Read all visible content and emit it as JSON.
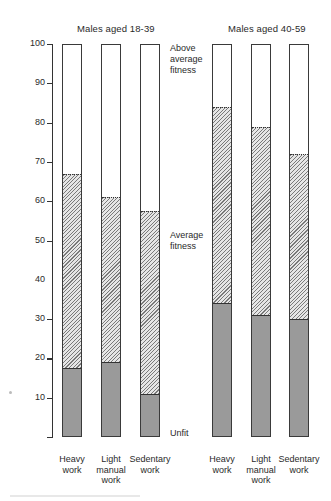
{
  "chart_data": {
    "type": "bar",
    "stacked": true,
    "title": "",
    "xlabel": "",
    "ylabel": "",
    "ylim": [
      0,
      100
    ],
    "yticks": [
      10,
      20,
      30,
      40,
      50,
      60,
      70,
      80,
      90,
      100
    ],
    "grid": false,
    "panels": [
      {
        "title": "Males aged 18-39",
        "categories": [
          "Heavy work",
          "Light manual work",
          "Sedentary work"
        ],
        "series": [
          {
            "name": "Unfit",
            "values": [
              17.5,
              19,
              11
            ]
          },
          {
            "name": "Average fitness",
            "values": [
              49.5,
              42,
              46.5
            ]
          },
          {
            "name": "Above average fitness",
            "values": [
              33,
              39,
              42.5
            ]
          }
        ],
        "boundaries": {
          "unfit_top": [
            17.5,
            19,
            11
          ],
          "average_top": [
            67,
            61,
            57.5
          ]
        }
      },
      {
        "title": "Males aged 40-59",
        "categories": [
          "Heavy work",
          "Light manual work",
          "Sedentary work"
        ],
        "series": [
          {
            "name": "Unfit",
            "values": [
              34,
              31,
              30
            ]
          },
          {
            "name": "Average fitness",
            "values": [
              50,
              48,
              42
            ]
          },
          {
            "name": "Above average fitness",
            "values": [
              16,
              21,
              28
            ]
          }
        ],
        "boundaries": {
          "unfit_top": [
            34,
            31,
            30
          ],
          "average_top": [
            84,
            79,
            72
          ]
        }
      }
    ],
    "legend": {
      "position": "inline-middle",
      "entries": [
        "Above average fitness",
        "Average fitness",
        "Unfit"
      ]
    }
  },
  "panels": [
    {
      "title": "Males aged 18-39",
      "xlabels": [
        [
          "Heavy",
          "work"
        ],
        [
          "Light",
          "manual",
          "work"
        ],
        [
          "Sedentary",
          "work"
        ]
      ]
    },
    {
      "title": "Males aged 40-59",
      "xlabels": [
        [
          "Heavy",
          "work"
        ],
        [
          "Light",
          "manual",
          "work"
        ],
        [
          "Sedentary",
          "work"
        ]
      ]
    }
  ],
  "yaxis": {
    "ticks": [
      "100",
      "90",
      "80",
      "70",
      "60",
      "50",
      "40",
      "30",
      "20",
      "10"
    ]
  },
  "side_labels": {
    "above": [
      "Above",
      "average",
      "fitness"
    ],
    "average": [
      "Average",
      "fitness"
    ],
    "unfit": [
      "Unfit"
    ]
  }
}
